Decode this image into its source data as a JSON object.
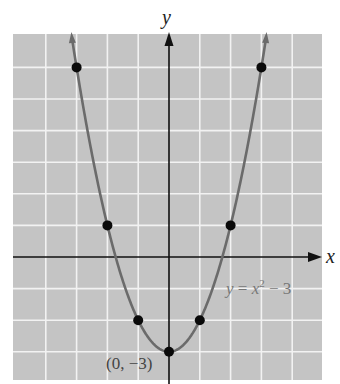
{
  "chart_data": {
    "type": "line",
    "title": "",
    "xlabel": "x",
    "ylabel": "y",
    "equation_label": "y = x² − 3",
    "function": "y = x^2 - 3",
    "xlim": [
      -5,
      5
    ],
    "ylim": [
      -3.9,
      7
    ],
    "grid": true,
    "grid_unit": 1,
    "points": [
      {
        "x": -3,
        "y": 6
      },
      {
        "x": -2,
        "y": 1
      },
      {
        "x": -1,
        "y": -2
      },
      {
        "x": 0,
        "y": -3
      },
      {
        "x": 1,
        "y": -2
      },
      {
        "x": 2,
        "y": 1
      },
      {
        "x": 3,
        "y": 6
      }
    ],
    "annotations": [
      {
        "text": "(0, −3)",
        "x": 0,
        "y": -3
      }
    ],
    "colors": {
      "grid_background": "#c4c4c4",
      "grid_lines": "#f2f2f2",
      "curve": "#6b6b6b",
      "axes": "#111111",
      "points": "#0a0a0a"
    }
  },
  "labels": {
    "x_axis": "x",
    "y_axis": "y",
    "eq_y": "y",
    "eq_eq": " = ",
    "eq_x": "x",
    "eq_exp": "2",
    "eq_rest": " − 3",
    "vertex": "(0, −3)"
  }
}
